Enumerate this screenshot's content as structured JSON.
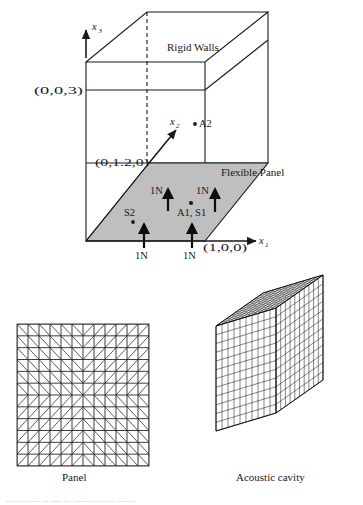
{
  "figure": {
    "title_partial_cutoff": "........ ..... .. .... ... ....... .... .... .......",
    "upper_diagram": {
      "name": "acoustic-cavity-with-flexible-panel-schematic",
      "labels": {
        "rigid_walls": "Rigid Walls",
        "flexible_panel": "Flexible Panel",
        "coord_top_left": "(0,0,3)",
        "coord_origin_y": "(0,1.2,0)",
        "coord_x_axis": "(1,0,0)",
        "axis_x1": "x",
        "axis_x1_sub": "1",
        "axis_x2": "x",
        "axis_x2_sub": "2",
        "axis_x3": "x",
        "axis_x3_sub": "3",
        "point_a2": "A2",
        "point_a2_marker": "•A2",
        "point_s2": "S2",
        "point_a1_s1": "A1, S1"
      },
      "forces": [
        {
          "label": "1N",
          "id": "force-upper-left"
        },
        {
          "label": "1N",
          "id": "force-upper-right"
        },
        {
          "label": "1N",
          "id": "force-lower-left"
        },
        {
          "label": "1N",
          "id": "force-lower-center"
        }
      ],
      "sensors": [
        {
          "id": "A2",
          "label": "A2",
          "kind": "accelerometer-in-cavity"
        },
        {
          "id": "S2",
          "label": "S2",
          "kind": "sensor-on-panel"
        },
        {
          "id": "A1S1",
          "label": "A1, S1",
          "kind": "actuator-sensor-pair"
        }
      ]
    },
    "lower_left_diagram": {
      "name": "panel-finite-element-mesh",
      "caption": "Panel",
      "mesh": {
        "type": "triangulated-quad-grid",
        "cols": 12,
        "rows": 12,
        "diagonal_pattern": "mirrored-quadrants"
      }
    },
    "lower_right_diagram": {
      "name": "acoustic-cavity-finite-element-mesh",
      "caption": "Acoustic cavity",
      "mesh": {
        "type": "isometric-hex-grid-box",
        "divisions_u": 10,
        "divisions_v": 10,
        "divisions_w": 12
      }
    },
    "colors": {
      "panel_fill": "#bfbfbf",
      "line": "#1a1a1a",
      "arrow": "#0d0d0d",
      "background": "#ffffff"
    }
  }
}
